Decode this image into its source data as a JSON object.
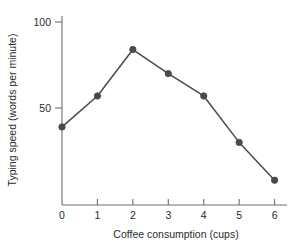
{
  "chart_data": {
    "type": "line",
    "title": "",
    "xlabel": "Coffee consumption (cups)",
    "ylabel": "Typing speed (words per minute)",
    "x": [
      0,
      1,
      2,
      3,
      4,
      5,
      6
    ],
    "values": [
      39,
      57,
      84,
      70,
      57,
      30,
      8
    ],
    "series": [
      {
        "name": "Typing speed",
        "values": [
          39,
          57,
          84,
          70,
          57,
          30,
          8
        ]
      }
    ],
    "xlim": [
      0,
      6.35
    ],
    "ylim": [
      0,
      108
    ],
    "xticks": [
      0,
      1,
      2,
      3,
      4,
      5,
      6
    ],
    "xtick_labels": [
      "0",
      "1",
      "2",
      "3",
      "4",
      "5",
      "6"
    ],
    "yticks": [
      50,
      100
    ],
    "ytick_labels": [
      "50",
      "100"
    ],
    "grid": false,
    "legend": false,
    "legend_position": "none",
    "marker": "filled-circle",
    "line_color": "#4a4a4a",
    "marker_color": "#4a4a4a",
    "axis_color": "#6e6e6e",
    "background_color": "#ffffff"
  }
}
